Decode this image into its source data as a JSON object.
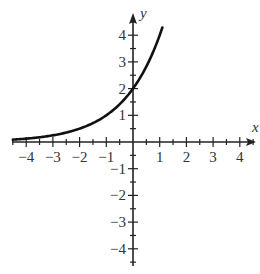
{
  "chart_data": {
    "type": "line",
    "title": "",
    "xlabel": "x",
    "ylabel": "y",
    "xlim": [
      -4.5,
      4.6
    ],
    "ylim": [
      -4.5,
      4.6
    ],
    "grid": false,
    "legend": null,
    "x_ticks": [
      -4,
      -3,
      -2,
      -1,
      1,
      2,
      3,
      4
    ],
    "y_ticks": [
      -4,
      -3,
      -2,
      -1,
      1,
      2,
      3,
      4
    ],
    "x_tick_labels": [
      "−4",
      "−3",
      "−2",
      "−1",
      "1",
      "2",
      "3",
      "4"
    ],
    "y_tick_labels": [
      "−4",
      "−3",
      "−2",
      "−1",
      "1",
      "2",
      "3",
      "4"
    ],
    "minor_tick_step": 0.5,
    "series": [
      {
        "name": "exponential curve",
        "function": "y = 2^(x+1)",
        "x_range": [
          -4.5,
          1.1
        ],
        "x": [
          -4.5,
          -4,
          -3,
          -2,
          -1,
          0,
          0.5,
          1,
          1.1
        ],
        "y": [
          0.088,
          0.125,
          0.25,
          0.5,
          1,
          2,
          2.83,
          4,
          4.29
        ],
        "y_intercept": 2,
        "asymptote": "y = 0",
        "color": "#111111"
      }
    ]
  },
  "colors": {
    "axis": "#222222",
    "curve": "#111111",
    "text": "#333333",
    "background": "#ffffff"
  }
}
